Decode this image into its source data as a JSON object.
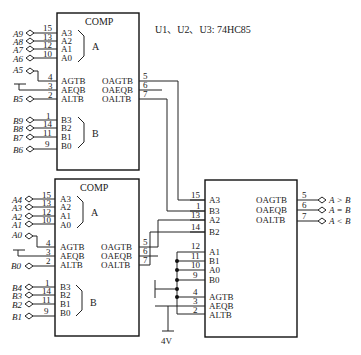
{
  "header": {
    "chip_note": "U1、U2、U3: 74HC85"
  },
  "u1": {
    "title": "COMP",
    "group_a_label": "A",
    "group_b_label": "B",
    "a_pins": [
      {
        "signal": "A9",
        "num": "15",
        "pin": "A3"
      },
      {
        "signal": "A8",
        "num": "13",
        "pin": "A2"
      },
      {
        "signal": "A7",
        "num": "12",
        "pin": "A1"
      },
      {
        "signal": "A6",
        "num": "10",
        "pin": "A0"
      }
    ],
    "cascade_pins": [
      {
        "signal": "A5",
        "num": "4",
        "pin": "AGTB"
      },
      {
        "signal": "",
        "num": "3",
        "pin": "AEQB"
      },
      {
        "signal": "B5",
        "num": "2",
        "pin": "ALTB"
      }
    ],
    "b_pins": [
      {
        "signal": "B9",
        "num": "1",
        "pin": "B3"
      },
      {
        "signal": "B8",
        "num": "14",
        "pin": "B2"
      },
      {
        "signal": "B7",
        "num": "11",
        "pin": "B1"
      },
      {
        "signal": "B6",
        "num": "9",
        "pin": "B0"
      }
    ],
    "outputs": [
      {
        "pin": "OAGTB",
        "num": "5"
      },
      {
        "pin": "OAEQB",
        "num": "6"
      },
      {
        "pin": "OALTB",
        "num": "7"
      }
    ]
  },
  "u2": {
    "title": "COMP",
    "group_a_label": "A",
    "group_b_label": "B",
    "a_pins": [
      {
        "signal": "A4",
        "num": "15",
        "pin": "A3"
      },
      {
        "signal": "A3",
        "num": "13",
        "pin": "A2"
      },
      {
        "signal": "A2",
        "num": "12",
        "pin": "A1"
      },
      {
        "signal": "A1",
        "num": "10",
        "pin": "A0"
      }
    ],
    "cascade_pins": [
      {
        "signal": "A0",
        "num": "4",
        "pin": "AGTB"
      },
      {
        "signal": "",
        "num": "3",
        "pin": "AEQB"
      },
      {
        "signal": "B0",
        "num": "2",
        "pin": "ALTB"
      }
    ],
    "b_pins": [
      {
        "signal": "B4",
        "num": "1",
        "pin": "B3"
      },
      {
        "signal": "B3",
        "num": "14",
        "pin": "B2"
      },
      {
        "signal": "B2",
        "num": "11",
        "pin": "B1"
      },
      {
        "signal": "B1",
        "num": "9",
        "pin": "B0"
      }
    ],
    "outputs": [
      {
        "pin": "OAGTB",
        "num": "5"
      },
      {
        "pin": "OAEQB",
        "num": "6"
      },
      {
        "pin": "OALTB",
        "num": "7"
      }
    ]
  },
  "u3": {
    "inputs": [
      {
        "num": "15",
        "pin": "A3"
      },
      {
        "num": "1",
        "pin": "B3"
      },
      {
        "num": "13",
        "pin": "A2"
      },
      {
        "num": "14",
        "pin": "B2"
      },
      {
        "num": "12",
        "pin": "A1"
      },
      {
        "num": "11",
        "pin": "B1"
      },
      {
        "num": "10",
        "pin": "A0"
      },
      {
        "num": "9",
        "pin": "B0"
      },
      {
        "num": "4",
        "pin": "AGTB"
      },
      {
        "num": "3",
        "pin": "AEQB"
      },
      {
        "num": "2",
        "pin": "ALTB"
      }
    ],
    "outputs": [
      {
        "pin": "OAGTB",
        "num": "5",
        "result": "A > B"
      },
      {
        "pin": "OAEQB",
        "num": "6",
        "result": "A = B"
      },
      {
        "pin": "OALTB",
        "num": "7",
        "result": "A < B"
      }
    ]
  },
  "supply": {
    "label": "4V"
  }
}
